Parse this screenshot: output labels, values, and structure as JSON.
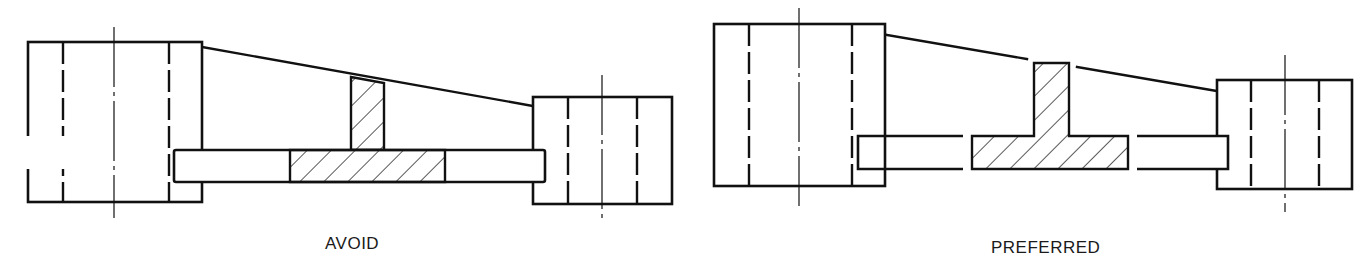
{
  "colors": {
    "stroke": "#111111",
    "background": "#ffffff",
    "text": "#1a1a1a"
  },
  "figures": [
    {
      "id": "avoid",
      "caption": "AVOID",
      "caption_pos": [
        325,
        234
      ],
      "boss_left": {
        "x": 28,
        "y": 42,
        "w": 174,
        "h": 160,
        "dashes": [
          63,
          169
        ],
        "center": [
          114,
          27,
          218
        ]
      },
      "boss_right": {
        "x": 533,
        "y": 97,
        "w": 139,
        "h": 107,
        "dashes": [
          568,
          637
        ],
        "center": [
          602,
          75,
          220
        ]
      },
      "taper": [
        [
          202,
          47
        ],
        [
          533,
          106
        ]
      ],
      "plate": {
        "x": 174,
        "y": 150,
        "w": 371,
        "h": 32
      },
      "hatched_flange": {
        "x": 290,
        "y": 150,
        "w": 155,
        "h": 32
      },
      "hatched_web": {
        "points": [
          [
            351,
            77
          ],
          [
            384,
            83
          ],
          [
            384,
            150
          ],
          [
            351,
            150
          ]
        ]
      }
    },
    {
      "id": "preferred",
      "caption": "PREFERRED",
      "caption_pos": [
        991,
        238
      ],
      "boss_left": {
        "x": 714,
        "y": 24,
        "w": 171,
        "h": 162,
        "dashes": [
          749,
          852
        ],
        "center": [
          799,
          8,
          206
        ]
      },
      "boss_right": {
        "x": 1217,
        "y": 80,
        "w": 135,
        "h": 109,
        "dashes": [
          1251,
          1319
        ],
        "center": [
          1285,
          55,
          212
        ]
      },
      "taper_segments": [
        [
          [
            887,
            35
          ],
          [
            1027,
            59
          ]
        ],
        [
          [
            1077,
            67
          ],
          [
            1217,
            91
          ]
        ]
      ],
      "plate_left": {
        "x1": 858,
        "x2": 963,
        "y": 136,
        "h": 33
      },
      "plate_right": {
        "x1": 1137,
        "x2": 1228,
        "y": 136,
        "h": 33
      },
      "hatched_tee": {
        "points": [
          [
            972,
            136
          ],
          [
            1034,
            136
          ],
          [
            1034,
            63
          ],
          [
            1069,
            63
          ],
          [
            1069,
            136
          ],
          [
            1128,
            136
          ],
          [
            1128,
            169
          ],
          [
            972,
            169
          ]
        ]
      }
    }
  ]
}
